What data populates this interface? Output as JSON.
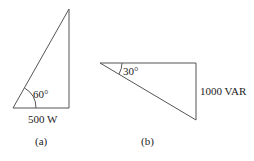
{
  "figure_a": {
    "angle_label": "60°",
    "base_label": "500 W",
    "caption": "(a)"
  },
  "figure_b": {
    "angle_label": "30°",
    "side_label": "1000 VAR",
    "caption": "(b)"
  }
}
